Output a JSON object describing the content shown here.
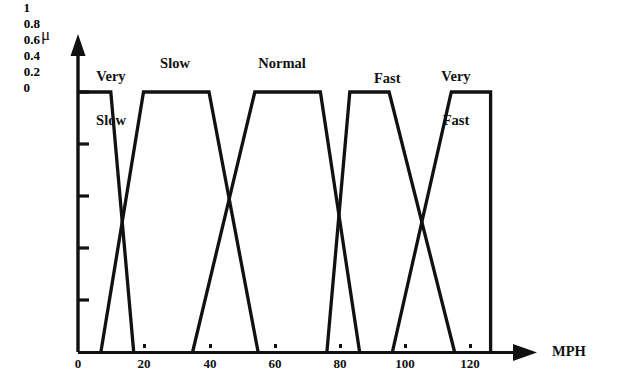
{
  "chart_data": {
    "type": "line",
    "title": "",
    "subtitle": "",
    "xlabel": "MPH",
    "ylabel": "μ",
    "xlim": [
      0,
      133
    ],
    "ylim": [
      0,
      1.05
    ],
    "grid": false,
    "legend_position": "inline-above-curves",
    "xticks": [
      0,
      20,
      40,
      60,
      80,
      100,
      120
    ],
    "xtick_labels": [
      "0",
      "20",
      "40",
      "60",
      "80",
      "100",
      "120"
    ],
    "yticks": [
      0,
      0.2,
      0.4,
      0.6,
      0.8,
      1
    ],
    "ytick_labels": [
      "0",
      "0.2",
      "0.4",
      "0.6",
      "0.8",
      "1"
    ],
    "annotations": [
      {
        "text": "Very\nSlow",
        "x": 10,
        "y": 1.12
      },
      {
        "text": "Slow",
        "x": 30,
        "y": 1.1
      },
      {
        "text": "Normal",
        "x": 62,
        "y": 1.1
      },
      {
        "text": "Fast",
        "x": 92,
        "y": 1.1
      },
      {
        "text": "Very\nFast",
        "x": 115,
        "y": 1.12
      }
    ],
    "series": [
      {
        "name": "Very Slow",
        "label": "Very\nSlow",
        "color": "#111111",
        "points": [
          [
            0,
            1
          ],
          [
            10,
            1
          ],
          [
            17,
            0
          ]
        ]
      },
      {
        "name": "Slow",
        "label": "Slow",
        "color": "#111111",
        "points": [
          [
            7,
            0
          ],
          [
            20,
            1
          ],
          [
            40,
            1
          ],
          [
            55,
            0
          ]
        ]
      },
      {
        "name": "Normal",
        "label": "Normal",
        "color": "#111111",
        "points": [
          [
            35,
            0
          ],
          [
            54,
            1
          ],
          [
            74,
            1
          ],
          [
            86,
            0
          ]
        ]
      },
      {
        "name": "Fast",
        "label": "Fast",
        "color": "#111111",
        "points": [
          [
            76,
            0
          ],
          [
            83,
            1
          ],
          [
            95,
            1
          ],
          [
            115,
            0
          ]
        ]
      },
      {
        "name": "Very Fast",
        "label": "Very\nFast",
        "color": "#111111",
        "points": [
          [
            96,
            0
          ],
          [
            114,
            1
          ],
          [
            126,
            1
          ],
          [
            126,
            0
          ]
        ]
      }
    ],
    "crossings": [
      {
        "between": [
          "Very Slow",
          "Slow"
        ],
        "x": 15,
        "y": 0.4
      },
      {
        "between": [
          "Slow",
          "Normal"
        ],
        "x": 46,
        "y": 0.5
      },
      {
        "between": [
          "Normal",
          "Fast"
        ],
        "x": 80,
        "y": 0.5
      },
      {
        "between": [
          "Fast",
          "Very Fast"
        ],
        "x": 105,
        "y": 0.5
      }
    ]
  },
  "axes": {
    "y_axis_title": "μ",
    "x_axis_title": "MPH",
    "y_tick_labels": [
      "1",
      "0.8",
      "0.6",
      "0.4",
      "0.2",
      "0"
    ],
    "x_tick_labels": [
      "0",
      "20",
      "40",
      "60",
      "80",
      "100",
      "120"
    ]
  },
  "labels": {
    "very_slow_line1": "Very",
    "very_slow_line2": "Slow",
    "slow": "Slow",
    "normal": "Normal",
    "fast": "Fast",
    "very_fast_line1": "Very",
    "very_fast_line2": "Fast"
  },
  "colors": {
    "ink": "#111111",
    "background": "#ffffff"
  }
}
